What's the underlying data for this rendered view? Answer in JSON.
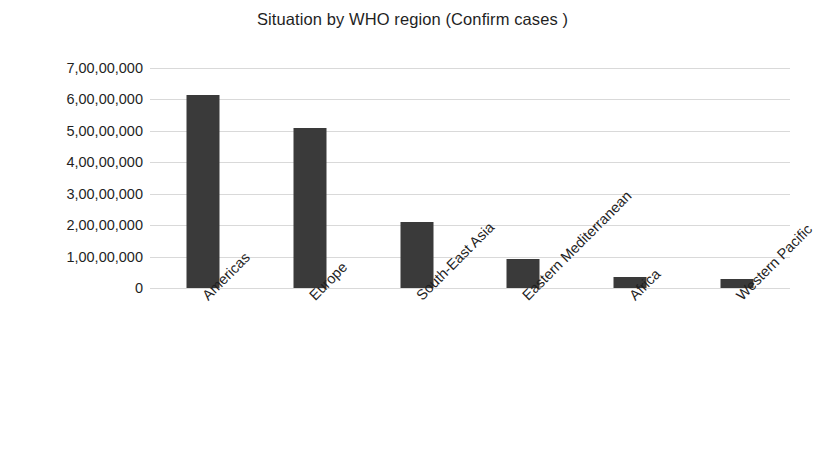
{
  "chart_data": {
    "type": "bar",
    "title": "Situation by WHO region (Confirm cases )",
    "xlabel": "",
    "ylabel": "",
    "categories": [
      "Americas",
      "Europe",
      "South-East Asia",
      "Eastern Mediterranean",
      "Africa",
      "Western Pacific"
    ],
    "values": [
      61500000,
      51000000,
      21000000,
      9200000,
      3500000,
      2800000
    ],
    "ylim": [
      0,
      70000000
    ],
    "ytick_values": [
      0,
      10000000,
      20000000,
      30000000,
      40000000,
      50000000,
      60000000,
      70000000
    ],
    "ytick_labels": [
      "0",
      "1,00,00,000",
      "2,00,00,000",
      "3,00,00,000",
      "4,00,00,000",
      "5,00,00,000",
      "6,00,00,000",
      "7,00,00,000"
    ],
    "grid": "horizontal",
    "legend": "none",
    "bar_color": "#3a3a3a",
    "gridline_color": "#d9d9d9",
    "background_color": "#ffffff",
    "xtick_rotation_degrees": -45
  }
}
